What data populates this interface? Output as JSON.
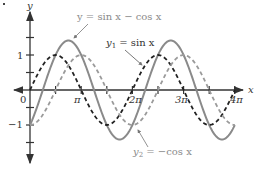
{
  "chart_data": {
    "type": "line",
    "title": "",
    "xlabel": "x",
    "ylabel": "y",
    "xlim": [
      0,
      12.566
    ],
    "ylim": [
      -1.6,
      1.6
    ],
    "grid": false,
    "x_ticks": [
      "0",
      "π",
      "2π",
      "3π",
      "4π"
    ],
    "y_ticks": [
      "1",
      "−1"
    ],
    "series": [
      {
        "name": "y = sin x − cos x",
        "expr": "sin(x) - cos(x)",
        "style": "solid",
        "color": "#8a8a8a",
        "x_range": [
          0,
          12.566
        ]
      },
      {
        "name": "y1 = sin x",
        "expr": "sin(x)",
        "style": "dashed",
        "color": "#222222",
        "x_range": [
          0,
          12.566
        ]
      },
      {
        "name": "y2 = −cos x",
        "expr": "-cos(x)",
        "style": "dashed",
        "color": "#9a9a9a",
        "x_range": [
          0,
          12.566
        ]
      }
    ],
    "annotations": [
      {
        "text": "y = sin x − cos x",
        "points_to": "sum curve peak near x=3π/4"
      },
      {
        "text": "y1 = sin x",
        "points_to": "sin curve near x=2π+π/4"
      },
      {
        "text": "y2 = −cos x",
        "points_to": "−cos curve near x=2π"
      }
    ]
  },
  "labels": {
    "y_axis": "y",
    "x_axis": "x",
    "origin": "0",
    "y_one": "1",
    "y_neg_one": "−1",
    "pi": "π",
    "two_pi": "2π",
    "three_pi": "3π",
    "four_pi": "4π",
    "sum_label": "y = sin x − cos x",
    "y1_label_main": "y",
    "y1_label_sub": "1",
    "y1_label_rest": " = sin x",
    "y2_label_main": "y",
    "y2_label_sub": "2",
    "y2_label_rest": " = −cos x"
  }
}
